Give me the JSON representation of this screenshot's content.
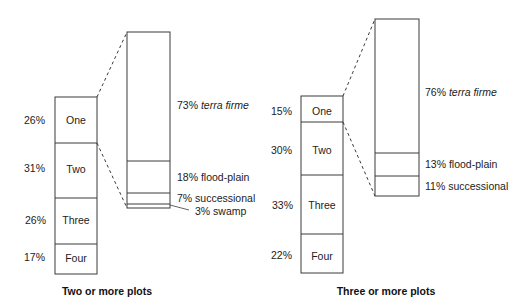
{
  "panels": [
    {
      "caption": "Two or more plots",
      "plot_counts": [
        {
          "label": "One",
          "percent": "26%"
        },
        {
          "label": "Two",
          "percent": "31%"
        },
        {
          "label": "Three",
          "percent": "26%"
        },
        {
          "label": "Four",
          "percent": "17%"
        }
      ],
      "forest_types": [
        {
          "percent": "73%",
          "name": "terra firme",
          "italic": true
        },
        {
          "percent": "18%",
          "name": "flood-plain",
          "italic": false
        },
        {
          "percent": "7%",
          "name": "successional",
          "italic": false
        },
        {
          "percent": "3%",
          "name": "swamp",
          "italic": false
        }
      ]
    },
    {
      "caption": "Three or more plots",
      "plot_counts": [
        {
          "label": "One",
          "percent": "15%"
        },
        {
          "label": "Two",
          "percent": "30%"
        },
        {
          "label": "Three",
          "percent": "33%"
        },
        {
          "label": "Four",
          "percent": "22%"
        }
      ],
      "forest_types": [
        {
          "percent": "76%",
          "name": "terra firme",
          "italic": true
        },
        {
          "percent": "13%",
          "name": "flood-plain",
          "italic": false
        },
        {
          "percent": "11%",
          "name": "successional",
          "italic": false
        }
      ]
    }
  ],
  "colors": {
    "stroke": "#3a3a3a",
    "text": "#222222",
    "background": "#ffffff"
  }
}
